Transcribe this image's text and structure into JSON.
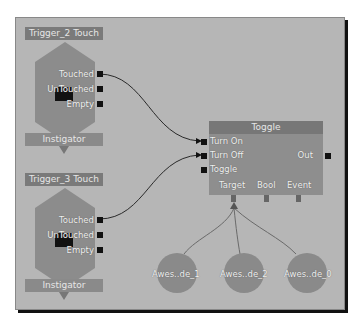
{
  "trigger_nodes": [
    {
      "title": "Trigger_2 Touch",
      "outputs": [
        "Touched",
        "UnTouched",
        "Empty"
      ],
      "footer": "Instigator"
    },
    {
      "title": "Trigger_3 Touch",
      "outputs": [
        "Touched",
        "UnTouched",
        "Empty"
      ],
      "footer": "Instigator"
    }
  ],
  "toggle_node": {
    "title": "Toggle",
    "inputs": [
      "Turn On",
      "Turn Off",
      "Toggle"
    ],
    "output": "Out",
    "variables": [
      "Target",
      "Bool",
      "Event"
    ]
  },
  "variable_nodes": [
    {
      "label": "Awes..de_1"
    },
    {
      "label": "Awes..de_2"
    },
    {
      "label": "Awes..de_0"
    }
  ],
  "colors": {
    "canvas": "#b6b6b6",
    "node_title": "#7a7a7a",
    "node_body": "#8e8e8e",
    "wire": "#2a2a2a"
  }
}
